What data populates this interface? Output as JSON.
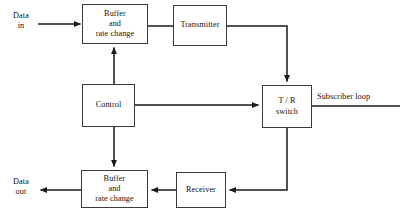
{
  "diagram": {
    "type": "block-diagram",
    "stroke_color": "#3a3a3a",
    "line_color": "#1a1a1a",
    "background": "#ffffff",
    "nodes": [
      {
        "id": "buffer_tx",
        "name": "buffer-rate-change-transmit",
        "lines": [
          "Buffer",
          "and",
          "rate change"
        ],
        "x": 82,
        "y": 4,
        "w": 66,
        "h": 40
      },
      {
        "id": "transmitter",
        "name": "transmitter",
        "lines": [
          "Transmitter"
        ],
        "x": 173,
        "y": 5,
        "w": 54,
        "h": 41
      },
      {
        "id": "control",
        "name": "control",
        "lines": [
          "Control"
        ],
        "x": 82,
        "y": 84,
        "w": 53,
        "h": 43
      },
      {
        "id": "tr_switch",
        "name": "tr-switch",
        "lines": [
          "T / R",
          "switch"
        ],
        "x": 262,
        "y": 85,
        "w": 50,
        "h": 43
      },
      {
        "id": "buffer_rx",
        "name": "buffer-rate-change-receive",
        "lines": [
          "Buffer",
          "and",
          "rate change"
        ],
        "x": 81,
        "y": 170,
        "w": 67,
        "h": 38
      },
      {
        "id": "receiver",
        "name": "receiver",
        "lines": [
          "Receiver"
        ],
        "x": 176,
        "y": 172,
        "w": 50,
        "h": 36
      }
    ],
    "labels": {
      "data_in_line1": "Data",
      "data_in_line2": "in",
      "data_out_line1": "Data",
      "data_out_line2": "out",
      "subscriber_loop": "Subscriber loop"
    },
    "edges": [
      {
        "id": "data_in_to_buffer",
        "name": "edge-data-in-to-buffer",
        "from": "Data in",
        "to": "Buffer and rate change",
        "arrow": true
      },
      {
        "id": "buffer_to_transmitter",
        "name": "edge-buffer-to-transmitter",
        "from": "Buffer and rate change",
        "to": "Transmitter",
        "arrow": false
      },
      {
        "id": "transmitter_to_tr",
        "name": "edge-transmitter-to-tr-switch",
        "from": "Transmitter",
        "to": "T / R switch",
        "arrow": true
      },
      {
        "id": "control_to_buffer_tx",
        "name": "edge-control-to-buffer-transmit",
        "from": "Control",
        "to": "Buffer and rate change",
        "arrow": true
      },
      {
        "id": "control_to_buffer_rx",
        "name": "edge-control-to-buffer-receive",
        "from": "Control",
        "to": "Buffer and rate change",
        "arrow": true
      },
      {
        "id": "control_to_tr",
        "name": "edge-control-to-tr-switch",
        "from": "Control",
        "to": "T / R switch",
        "arrow": true
      },
      {
        "id": "tr_to_receiver",
        "name": "edge-tr-switch-to-receiver",
        "from": "T / R switch",
        "to": "Receiver",
        "arrow": true
      },
      {
        "id": "receiver_to_buffer",
        "name": "edge-receiver-to-buffer",
        "from": "Receiver",
        "to": "Buffer and rate change",
        "arrow": true
      },
      {
        "id": "buffer_to_data_out",
        "name": "edge-buffer-to-data-out",
        "from": "Buffer and rate change",
        "to": "Data out",
        "arrow": true
      },
      {
        "id": "tr_to_subscriber_loop",
        "name": "edge-tr-switch-to-subscriber-loop",
        "from": "T / R switch",
        "to": "Subscriber loop",
        "arrow": false
      }
    ]
  }
}
